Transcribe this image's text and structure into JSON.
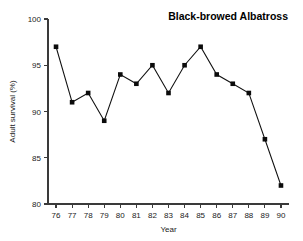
{
  "chart_data": {
    "type": "line",
    "title": "Black-browed Albatross",
    "xlabel": "Year",
    "ylabel": "Adult survival (%)",
    "categories": [
      "76",
      "77",
      "78",
      "79",
      "80",
      "81",
      "82",
      "83",
      "84",
      "85",
      "86",
      "87",
      "88",
      "89",
      "90"
    ],
    "x": [
      76,
      77,
      78,
      79,
      80,
      81,
      82,
      83,
      84,
      85,
      86,
      87,
      88,
      89,
      90
    ],
    "values": [
      97,
      91,
      92,
      89,
      94,
      93,
      95,
      92,
      95,
      97,
      94,
      93,
      92,
      87,
      82
    ],
    "ylim": [
      80,
      100
    ],
    "xlim": [
      75.5,
      90.5
    ],
    "yticks": [
      80,
      85,
      90,
      95,
      100
    ],
    "ytick_labels": [
      "80",
      "85",
      "90",
      "95",
      "100"
    ],
    "xticks": [
      76,
      77,
      78,
      79,
      80,
      81,
      82,
      83,
      84,
      85,
      86,
      87,
      88,
      89,
      90
    ],
    "xtick_labels": [
      "76",
      "77",
      "78",
      "79",
      "80",
      "81",
      "82",
      "83",
      "84",
      "85",
      "86",
      "87",
      "88",
      "89",
      "90"
    ],
    "grid": false,
    "legend": null,
    "marker": "filled-square",
    "line_color": "#101010",
    "marker_color": "#0b0b0b",
    "background_color": "#ffffff",
    "title_position": "top-right"
  }
}
